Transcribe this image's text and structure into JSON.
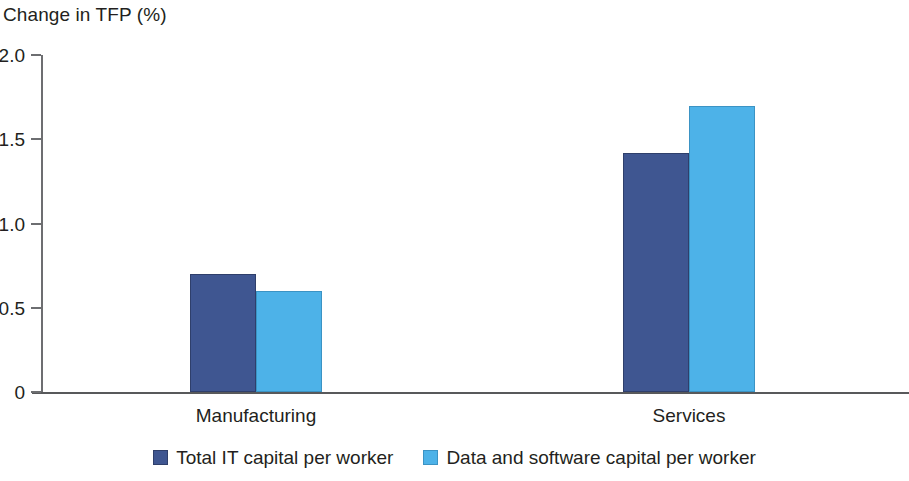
{
  "chart_data": {
    "type": "bar",
    "title": "Change in TFP (%)",
    "xlabel": "",
    "ylabel": "Change in TFP (%)",
    "categories": [
      "Manufacturing",
      "Services"
    ],
    "series": [
      {
        "name": "Total IT capital per worker",
        "color": "#3f5691",
        "values": [
          0.7,
          1.42
        ]
      },
      {
        "name": "Data and software capital per worker",
        "color": "#4db2e8",
        "values": [
          0.6,
          1.7
        ]
      }
    ],
    "ylim": [
      0,
      2.0
    ],
    "yticks": [
      {
        "value": 2.0,
        "label": "2.0"
      },
      {
        "value": 1.5,
        "label": "1.5"
      },
      {
        "value": 1.0,
        "label": "1.0"
      },
      {
        "value": 0.5,
        "label": "0.5"
      },
      {
        "value": 0.0,
        "label": "0"
      }
    ],
    "grid": false,
    "legend_position": "bottom"
  }
}
